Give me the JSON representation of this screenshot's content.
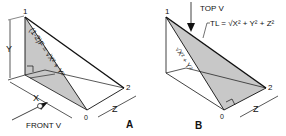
{
  "figure": {
    "panel_a": {
      "label": "A",
      "points": {
        "p1": "1",
        "p2": "2",
        "p0": "0"
      },
      "dims": {
        "x": "X",
        "y": "Y",
        "z": "Z"
      },
      "hyp_formula": "(1-2)F = √X² + Y²",
      "front_view_label": "FRONT V"
    },
    "panel_b": {
      "label": "B",
      "points": {
        "p1": "1",
        "p2": "2",
        "p0": "0"
      },
      "dims": {
        "z": "Z"
      },
      "top_view_label": "TOP V",
      "tl_formula": "TL = √X² + Y² + Z²",
      "diag_formula": "√X² + Y²"
    },
    "colors": {
      "shade": "#c8c8c8",
      "line": "#111111"
    }
  }
}
